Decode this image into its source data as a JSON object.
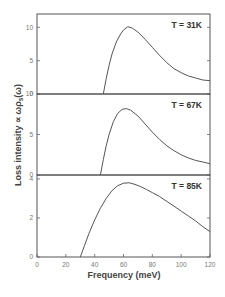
{
  "chart_data": {
    "type": "line",
    "layout": "three vertically stacked panels sharing x-axis",
    "xlabel": "Frequency (meV)",
    "ylabel": "Loss intensity ∝ ωρs(ω)",
    "xlim": [
      0,
      120
    ],
    "x_ticks": [
      0,
      20,
      40,
      60,
      80,
      100,
      120
    ],
    "grid": false,
    "panels": [
      {
        "label": "T = 31K",
        "ylim": [
          0,
          12
        ],
        "y_ticks": [
          0,
          5,
          10
        ],
        "series": {
          "name": "T = 31K",
          "x": [
            46,
            48,
            50,
            52,
            55,
            58,
            60,
            63,
            66,
            70,
            75,
            80,
            85,
            90,
            95,
            100,
            105,
            110,
            115,
            120
          ],
          "y": [
            0,
            2.3,
            4.3,
            6.0,
            7.8,
            9.0,
            9.6,
            10.1,
            9.9,
            9.3,
            8.2,
            7.0,
            5.8,
            4.7,
            3.8,
            3.2,
            2.7,
            2.4,
            2.1,
            2.0
          ]
        }
      },
      {
        "label": "T = 67K",
        "ylim": [
          0,
          10
        ],
        "y_ticks": [
          0,
          5,
          10
        ],
        "series": {
          "name": "T = 67K",
          "x": [
            44,
            46,
            48,
            50,
            53,
            56,
            59,
            62,
            65,
            70,
            75,
            80,
            85,
            90,
            95,
            100,
            105,
            110,
            115,
            120
          ],
          "y": [
            0,
            1.9,
            3.6,
            5.0,
            6.6,
            7.6,
            8.1,
            8.2,
            8.0,
            7.3,
            6.3,
            5.3,
            4.4,
            3.6,
            3.0,
            2.5,
            2.1,
            1.8,
            1.6,
            1.4
          ]
        }
      },
      {
        "label": "T = 85K",
        "ylim": [
          0,
          4.2
        ],
        "y_ticks": [
          0,
          2,
          4
        ],
        "series": {
          "name": "T = 85K",
          "x": [
            30,
            33,
            36,
            40,
            44,
            48,
            52,
            56,
            60,
            64,
            68,
            72,
            76,
            80,
            85,
            90,
            95,
            100,
            105,
            110,
            115,
            120
          ],
          "y": [
            0,
            0.6,
            1.2,
            1.9,
            2.5,
            3.0,
            3.4,
            3.65,
            3.78,
            3.8,
            3.72,
            3.6,
            3.45,
            3.3,
            3.1,
            2.85,
            2.6,
            2.35,
            2.1,
            1.85,
            1.55,
            1.3
          ]
        }
      }
    ]
  },
  "text": {
    "xlabel": "Frequency (meV)",
    "ylabel_main": "Loss intensity ∝ ωρ",
    "ylabel_sub": "s",
    "ylabel_tail": "(ω)",
    "panel_labels": [
      "T = 31K",
      "T = 67K",
      "T = 85K"
    ]
  }
}
